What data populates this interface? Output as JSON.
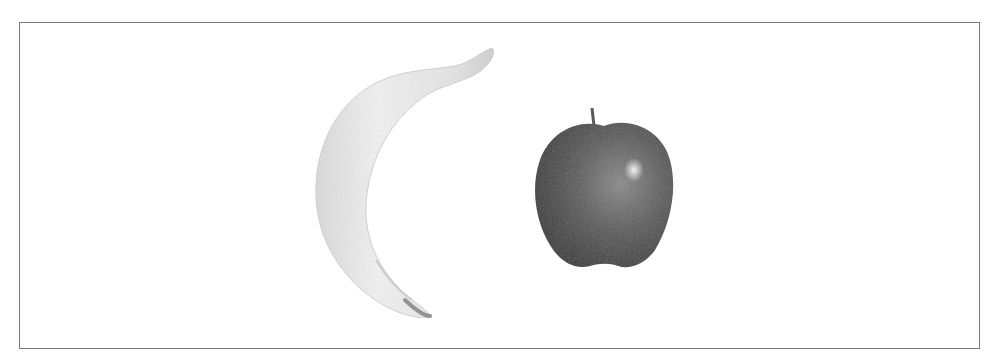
{
  "image": {
    "description": "Grayscale photo of a banana and an apple on a white background inside a thin gray border",
    "objects": [
      {
        "name": "banana",
        "position": "left-center"
      },
      {
        "name": "apple",
        "position": "center-right"
      }
    ],
    "colors": {
      "border": "#7a7a7a",
      "background": "#ffffff",
      "banana_light": "#f2f2f2",
      "banana_shade": "#c8c8c8",
      "apple_dark": "#3e3e3e",
      "apple_mid": "#6a6a6a"
    }
  }
}
